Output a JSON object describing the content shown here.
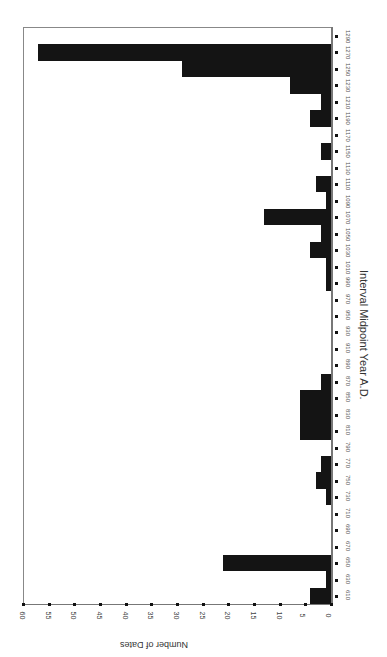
{
  "chart_data": {
    "type": "bar",
    "orientation": "rotated-90",
    "title": "",
    "xlabel": "Interval Midpoint Year A.D.",
    "ylabel": "Number of Dates",
    "ylim": [
      0,
      60
    ],
    "yticks": [
      0,
      5,
      10,
      15,
      20,
      25,
      30,
      35,
      40,
      45,
      50,
      55,
      60
    ],
    "categories": [
      610,
      630,
      650,
      670,
      690,
      710,
      730,
      750,
      770,
      790,
      810,
      830,
      850,
      870,
      890,
      910,
      930,
      950,
      970,
      990,
      1010,
      1030,
      1050,
      1070,
      1090,
      1110,
      1130,
      1150,
      1170,
      1190,
      1210,
      1230,
      1250,
      1270,
      1290
    ],
    "tick_labels": [
      "610",
      "630",
      "650",
      "670",
      "690",
      "710",
      "730",
      "750",
      "770",
      "790",
      "810",
      "830",
      "850",
      "870",
      "890",
      "910",
      "930",
      "950",
      "970",
      "990",
      "1010",
      "1030",
      "1050",
      "1070",
      "1090",
      "1110",
      "1130",
      "1150",
      "1170",
      "1190",
      "1210",
      "1230",
      "1250",
      "1270",
      "1290"
    ],
    "values": [
      4,
      1,
      21,
      0,
      0,
      0,
      1,
      3,
      2,
      0,
      6,
      6,
      6,
      2,
      0,
      0,
      0,
      0,
      0,
      1,
      1,
      4,
      2,
      13,
      1,
      3,
      0,
      2,
      0,
      4,
      2,
      8,
      29,
      57,
      0
    ],
    "grid": false,
    "legend": null
  },
  "labels": {
    "xtitle": "Interval Midpoint Year A.D.",
    "ytitle": "Number of Dates"
  }
}
